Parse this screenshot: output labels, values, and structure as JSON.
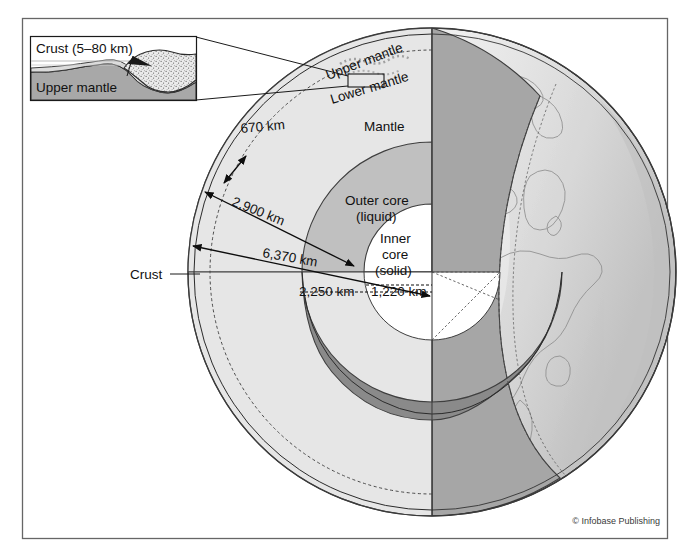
{
  "figure": {
    "credit": "© Infobase Publishing"
  },
  "inset": {
    "name": "crust-detail-inset",
    "crust_label": "Crust (5–80 km)",
    "upper_mantle_label": "Upper mantle"
  },
  "layers": {
    "upper_mantle": "Upper mantle",
    "lower_mantle": "Lower mantle",
    "mantle": "Mantle",
    "outer_core_line1": "Outer core",
    "outer_core_line2": "(liquid)",
    "inner_core_line1": "Inner",
    "inner_core_line2": "core",
    "inner_core_line3": "(solid)",
    "crust": "Crust"
  },
  "dimensions": {
    "upper_mantle_depth": "670 km",
    "mantle_depth": "2,900 km",
    "earth_radius": "6,370 km",
    "outer_core_radius": "2,250 km",
    "inner_core_radius": "1,220 km"
  },
  "colors": {
    "background": "#ffffff",
    "frame_stroke": "#555555",
    "surface_light": "#efefef",
    "surface_shade": "#c9c9c9",
    "mantle_cut": "#e2e2e2",
    "mantle_shade": "#a9a9a9",
    "outer_core_cut": "#bdbdbd",
    "outer_core_shade": "#8c8c8c",
    "inner_core_cut": "#ffffff",
    "inset_mantle_fill": "#a8a8a8",
    "inset_crust_fill": "#e6e6e6",
    "text": "#111111"
  }
}
